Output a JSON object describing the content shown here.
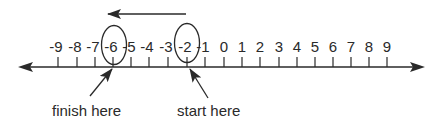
{
  "diagram": {
    "type": "number-line",
    "range": [
      -9,
      9
    ],
    "colors": {
      "ink": "#2a2a2a",
      "background": "#ffffff"
    },
    "ticks": [
      {
        "value": -9,
        "label": "-9",
        "x": 58
      },
      {
        "value": -8,
        "label": "-8",
        "x": 77
      },
      {
        "value": -7,
        "label": "-7",
        "x": 95
      },
      {
        "value": -6,
        "label": "-6",
        "x": 113
      },
      {
        "value": -5,
        "label": "-5",
        "x": 131
      },
      {
        "value": -4,
        "label": "-4",
        "x": 149
      },
      {
        "value": -3,
        "label": "-3",
        "x": 168
      },
      {
        "value": -2,
        "label": "-2",
        "x": 187
      },
      {
        "value": -1,
        "label": "-1",
        "x": 205
      },
      {
        "value": 0,
        "label": "0",
        "x": 224
      },
      {
        "value": 1,
        "label": "1",
        "x": 242
      },
      {
        "value": 2,
        "label": "2",
        "x": 260
      },
      {
        "value": 3,
        "label": "3",
        "x": 279
      },
      {
        "value": 4,
        "label": "4",
        "x": 297
      },
      {
        "value": 5,
        "label": "5",
        "x": 315
      },
      {
        "value": 6,
        "label": "6",
        "x": 333
      },
      {
        "value": 7,
        "label": "7",
        "x": 351
      },
      {
        "value": 8,
        "label": "8",
        "x": 369
      },
      {
        "value": 9,
        "label": "9",
        "x": 387
      }
    ],
    "circled_values": [
      -6,
      -2
    ],
    "direction_arrow": {
      "from": -2,
      "to": -6,
      "direction": "left"
    },
    "annotations": {
      "finish": {
        "label": "finish here",
        "value": -6
      },
      "start": {
        "label": "start here",
        "value": -2
      }
    }
  }
}
